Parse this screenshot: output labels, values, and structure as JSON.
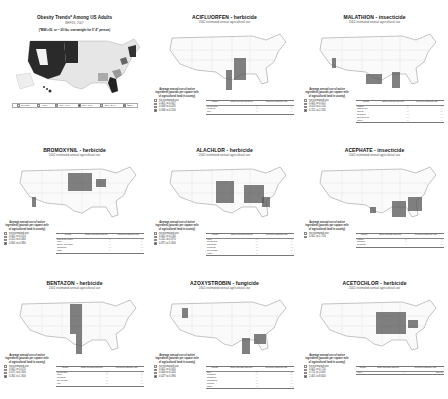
{
  "obesity_panel": {
    "title": "Obesity Trends* Among US Adults",
    "subtitle": "BRFSS, 2007",
    "note": "(*BMI ≥30, or ~ 30 lbs. overweight for 5' 4\" person)",
    "legend": [
      {
        "label": "No Data",
        "color": "#ffffff"
      },
      {
        "label": "<10%",
        "color": "#eeeeee"
      },
      {
        "label": "10%–14%",
        "color": "#bbbbbb"
      },
      {
        "label": "15%–19%",
        "color": "#333333"
      },
      {
        "label": "20%–24%",
        "color": "#dddddd"
      },
      {
        "label": "≥25%",
        "color": "#888888"
      }
    ]
  },
  "panels": [
    {
      "title": "ACIFLUORFEN - herbicide",
      "subtitle": "2002 estimated annual agricultural use",
      "legend_head": "Average annual use of active ingredient (pounds per square mile of agricultural land in county)",
      "legend": [
        "no estimated use",
        "0.001 to 0.007",
        "0.008 to 0.035",
        "0.036 to 0.200"
      ],
      "table_headers": [
        "Crops",
        "Total pounds applied",
        "Percent national use"
      ],
      "table_rows": [
        [
          "soybeans",
          "—",
          "—"
        ],
        [
          "peanuts",
          "—",
          "—"
        ],
        [
          "rice",
          "—",
          "—"
        ]
      ]
    },
    {
      "title": "MALATHION - insecticide",
      "subtitle": "2002 estimated annual agricultural use",
      "legend_head": "Average annual use of active ingredient (pounds per square mile of agricultural land in county)",
      "legend": [
        "no estimated use",
        "0.001 to 0.012",
        "0.013 to 0.150",
        "0.151 to 2.200"
      ],
      "table_headers": [
        "Crops",
        "Total pounds applied",
        "Percent national use"
      ],
      "table_rows": [
        [
          "cotton",
          "—",
          "—"
        ],
        [
          "alfalfa hay",
          "—",
          "—"
        ],
        [
          "wheat",
          "—",
          "—"
        ],
        [
          "oranges",
          "—",
          "—"
        ],
        [
          "blueberries",
          "—",
          "—"
        ],
        [
          "other",
          "—",
          "—"
        ]
      ]
    },
    {
      "title": "BROMOXYNIL - herbicide",
      "subtitle": "2002 estimated annual agricultural use",
      "legend_head": "Average annual use of active ingredient (pounds per square mile of agricultural land in county)",
      "legend": [
        "no estimated use",
        "0.001 to 0.014",
        "0.015 to 0.060",
        "0.061 to 0.380"
      ],
      "table_headers": [
        "Crops",
        "Total pounds applied",
        "Percent national use"
      ],
      "table_rows": [
        [
          "wheat for grain",
          "—",
          "—"
        ],
        [
          "corn",
          "—",
          "—"
        ],
        [
          "barley for grain",
          "—",
          "—"
        ],
        [
          "sorghum",
          "—",
          "—"
        ],
        [
          "oats",
          "—",
          "—"
        ]
      ]
    },
    {
      "title": "ALACHLOR - herbicide",
      "subtitle": "2002 estimated annual agricultural use",
      "legend_head": "Average annual use of active ingredient (pounds per square mile of agricultural land in county)",
      "legend": [
        "no estimated use",
        "0.001 to 0.240",
        "0.241 to 0.870",
        "0.871 to 5.300"
      ],
      "table_headers": [
        "Crops",
        "Total pounds applied",
        "Percent national use"
      ],
      "table_rows": [
        [
          "corn",
          "—",
          "—"
        ],
        [
          "soybeans",
          "—",
          "—"
        ],
        [
          "sorghum",
          "—",
          "—"
        ],
        [
          "peanuts",
          "—",
          "—"
        ],
        [
          "dry beans",
          "—",
          "—"
        ],
        [
          "other",
          "—",
          "—"
        ]
      ]
    },
    {
      "title": "ACEPHATE - insecticide",
      "subtitle": "2002 estimated annual agricultural use",
      "legend_head": "Average annual use of active ingredient (pounds per square mile of agricultural land in county)",
      "legend": [
        "no estimated use",
        "0.001 to 1.700"
      ],
      "table_headers": [
        "Crops",
        "Total pounds applied",
        "Percent national use"
      ],
      "table_rows": [
        [
          "cotton",
          "—",
          "—"
        ],
        [
          "tobacco",
          "—",
          "—"
        ],
        [
          "peanuts",
          "—",
          "—"
        ]
      ]
    },
    {
      "title": "BENTAZON - herbicide",
      "subtitle": "2002 estimated annual agricultural use",
      "legend_head": "Average annual use of active ingredient (pounds per square mile of agricultural land in county)",
      "legend": [
        "no estimated use",
        "0.001 to 0.070",
        "0.071 to 0.300",
        "0.301 to 1.300"
      ],
      "table_headers": [
        "Crops",
        "Total pounds applied",
        "Percent national use"
      ],
      "table_rows": [
        [
          "soybeans",
          "—",
          "—"
        ],
        [
          "corn",
          "—",
          "—"
        ],
        [
          "peanuts",
          "—",
          "—"
        ],
        [
          "dry beans",
          "—",
          "—"
        ],
        [
          "rice",
          "—",
          "—"
        ]
      ]
    },
    {
      "title": "AZOXYSTROBIN - fungicide",
      "subtitle": "2002 estimated annual agricultural use",
      "legend_head": "Average annual use of active ingredient (pounds per square mile of agricultural land in county)",
      "legend": [
        "no estimated use",
        "0.001 to 0.005",
        "0.006 to 0.026",
        "0.027 to 0.390"
      ],
      "table_headers": [
        "Crops",
        "Total pounds applied",
        "Percent national use"
      ],
      "table_rows": [
        [
          "rice",
          "—",
          "—"
        ],
        [
          "peanuts",
          "—",
          "—"
        ],
        [
          "potatoes",
          "—",
          "—"
        ],
        [
          "tomatoes",
          "—",
          "—"
        ],
        [
          "grapes",
          "—",
          "—"
        ],
        [
          "other",
          "—",
          "—"
        ]
      ]
    },
    {
      "title": "ACETOCHLOR - herbicide",
      "subtitle": "2002 estimated annual agricultural use",
      "legend_head": "Average annual use of active ingredient (pounds per square mile of agricultural land in county)",
      "legend": [
        "no estimated use",
        "0.001 to 0.710",
        "0.711 to 2.400",
        "2.401 to 8.600"
      ],
      "table_headers": [
        "Crops",
        "Total pounds applied",
        "Percent national use"
      ],
      "table_rows": [
        [
          "corn",
          "—",
          "100.00"
        ]
      ]
    }
  ]
}
